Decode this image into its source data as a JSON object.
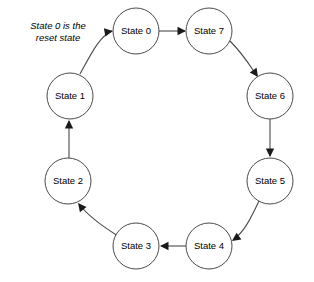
{
  "diagram": {
    "type": "state-transition-diagram",
    "annotation": {
      "text": "State 0 is the\nreset state",
      "line1": "State 0 is the",
      "line2": "reset state",
      "x": 18,
      "y": 20,
      "width": 80
    },
    "colors": {
      "background": "#ffffff",
      "node_stroke": "#4a4a4a",
      "node_fill": "#ffffff",
      "edge_stroke": "#4a4a4a",
      "arrow_fill": "#1a1a1a",
      "text": "#000000"
    },
    "nodes": [
      {
        "id": "state0",
        "label": "State 0",
        "cx": 136,
        "cy": 31,
        "r": 23
      },
      {
        "id": "state7",
        "label": "State 7",
        "cx": 209,
        "cy": 31,
        "r": 23
      },
      {
        "id": "state6",
        "label": "State 6",
        "cx": 270,
        "cy": 96,
        "r": 23
      },
      {
        "id": "state5",
        "label": "State 5",
        "cx": 270,
        "cy": 181,
        "r": 23
      },
      {
        "id": "state4",
        "label": "State 4",
        "cx": 209,
        "cy": 246,
        "r": 23
      },
      {
        "id": "state3",
        "label": "State 3",
        "cx": 136,
        "cy": 246,
        "r": 23
      },
      {
        "id": "state2",
        "label": "State 2",
        "cx": 68,
        "cy": 181,
        "r": 23
      },
      {
        "id": "state1",
        "label": "State 1",
        "cx": 70,
        "cy": 96,
        "r": 23
      }
    ],
    "edges": [
      {
        "id": "e-1-0",
        "from": "state1",
        "to": "state0",
        "path": "M 80,74 C 92,52 100,36 112,31",
        "arrow": {
          "x": 113,
          "y": 31,
          "angle": -10
        }
      },
      {
        "id": "e-0-7",
        "from": "state0",
        "to": "state7",
        "path": "M 159,31 L 185,31",
        "arrow": {
          "x": 186,
          "y": 31,
          "angle": 0
        }
      },
      {
        "id": "e-7-6",
        "from": "state7",
        "to": "state6",
        "path": "M 230,41 C 243,54 249,64 257,76",
        "arrow": {
          "x": 258,
          "y": 77,
          "angle": 55
        }
      },
      {
        "id": "e-6-5",
        "from": "state6",
        "to": "state5",
        "path": "M 270,119 L 270,156",
        "arrow": {
          "x": 270,
          "y": 157,
          "angle": 90
        }
      },
      {
        "id": "e-5-4",
        "from": "state5",
        "to": "state4",
        "path": "M 259,201 C 250,220 244,232 233,240",
        "arrow": {
          "x": 232,
          "y": 241,
          "angle": 145
        }
      },
      {
        "id": "e-4-3",
        "from": "state4",
        "to": "state3",
        "path": "M 186,246 L 161,246",
        "arrow": {
          "x": 160,
          "y": 246,
          "angle": 180
        }
      },
      {
        "id": "e-3-2",
        "from": "state3",
        "to": "state2",
        "path": "M 118,236 C 102,226 88,216 79,204",
        "arrow": {
          "x": 78,
          "y": 203,
          "angle": 232
        }
      },
      {
        "id": "e-2-1",
        "from": "state2",
        "to": "state1",
        "path": "M 69,158 L 69,121",
        "arrow": {
          "x": 69,
          "y": 120,
          "angle": 270
        }
      }
    ]
  }
}
